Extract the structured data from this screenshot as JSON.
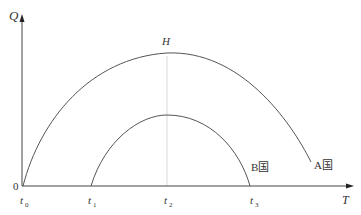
{
  "diagram": {
    "axes": {
      "y_label": "Q",
      "x_label": "T",
      "origin_label": "0"
    },
    "peak_label": "H",
    "ticks": [
      {
        "base": "t",
        "sub": "0"
      },
      {
        "base": "t",
        "sub": "1"
      },
      {
        "base": "t",
        "sub": "2"
      },
      {
        "base": "t",
        "sub": "3"
      }
    ],
    "curves": [
      {
        "name": "A国",
        "description": "larger arch from t0, peak H at t2, descending to right end"
      },
      {
        "name": "B国",
        "description": "smaller arch from t1, peak at t2, ending at t3"
      }
    ],
    "colors": {
      "line": "#555555",
      "axis": "#444444",
      "guide": "#cccccc"
    }
  }
}
